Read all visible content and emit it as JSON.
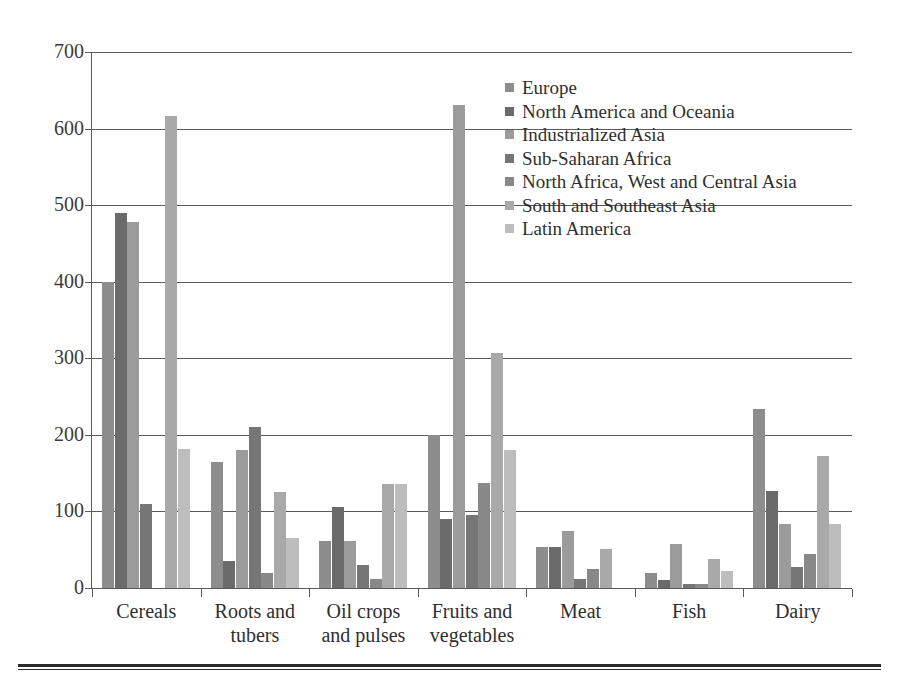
{
  "chart_data": {
    "type": "bar",
    "title": "",
    "subtitle": "",
    "xlabel": "",
    "ylabel": "",
    "ylim": [
      0,
      700
    ],
    "ytick_values": [
      0,
      100,
      200,
      300,
      400,
      500,
      600,
      700
    ],
    "ytick_labels": [
      "0",
      "100",
      "200",
      "300",
      "400",
      "500",
      "600",
      "700"
    ],
    "grid": true,
    "legend_position": "inside-top-center",
    "categories": [
      "Cereals",
      "Roots and tubers",
      "Oil crops and pulses",
      "Fruits and vegetables",
      "Meat",
      "Fish",
      "Dairy"
    ],
    "category_lines": [
      [
        "Cereals"
      ],
      [
        "Roots and",
        "tubers"
      ],
      [
        "Oil crops",
        "and pulses"
      ],
      [
        "Fruits and",
        "vegetables"
      ],
      [
        "Meat"
      ],
      [
        "Fish"
      ],
      [
        "Dairy"
      ]
    ],
    "series": [
      {
        "name": "Europe",
        "color": "#8d8d8d",
        "values": [
          400,
          165,
          62,
          200,
          53,
          20,
          234
        ]
      },
      {
        "name": "North America and Oceania",
        "color": "#6b6b6b",
        "values": [
          490,
          35,
          106,
          90,
          53,
          10,
          127
        ]
      },
      {
        "name": "Industrialized Asia",
        "color": "#9b9b9b",
        "values": [
          478,
          180,
          62,
          631,
          75,
          57,
          84
        ]
      },
      {
        "name": "Sub-Saharan Africa",
        "color": "#767676",
        "values": [
          110,
          210,
          30,
          95,
          12,
          5,
          28
        ]
      },
      {
        "name": "North Africa, West and Central Asia",
        "color": "#888888",
        "values": [
          0,
          20,
          12,
          137,
          25,
          5,
          44
        ]
      },
      {
        "name": "South and Southeast Asia",
        "color": "#a9a9a9",
        "values": [
          617,
          126,
          136,
          307,
          51,
          38,
          172
        ]
      },
      {
        "name": "Latin America",
        "color": "#bdbdbd",
        "values": [
          182,
          65,
          136,
          180,
          0,
          22,
          83
        ]
      }
    ]
  }
}
